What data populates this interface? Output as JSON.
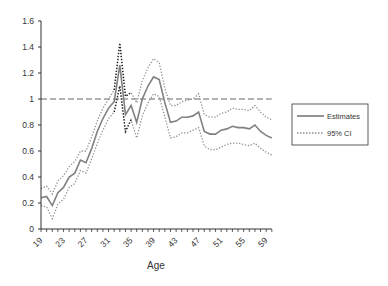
{
  "chart_data": {
    "type": "line",
    "title": "",
    "xlabel": "Age",
    "ylabel": "",
    "ylim": [
      0,
      1.6
    ],
    "xlim": [
      19,
      60
    ],
    "yticks": [
      "0",
      "0.2",
      "0.4",
      "0.6",
      "0.8",
      "1",
      "1.2",
      "1.4",
      "1.6"
    ],
    "xticks": [
      "19",
      "23",
      "27",
      "31",
      "35",
      "39",
      "43",
      "47",
      "51",
      "55",
      "59"
    ],
    "grid": false,
    "legend_position": "right",
    "reference_line": {
      "y": 1,
      "style": "dashed"
    },
    "x": [
      19,
      20,
      21,
      22,
      23,
      24,
      25,
      26,
      27,
      28,
      29,
      30,
      31,
      32,
      33,
      34,
      35,
      36,
      37,
      38,
      39,
      40,
      41,
      42,
      43,
      44,
      45,
      46,
      47,
      48,
      49,
      50,
      51,
      52,
      53,
      54,
      55,
      56,
      57,
      58,
      59,
      60
    ],
    "series": [
      {
        "name": "Estimates",
        "style": "solid",
        "values": [
          0.24,
          0.25,
          0.18,
          0.28,
          0.32,
          0.4,
          0.43,
          0.53,
          0.51,
          0.62,
          0.75,
          0.85,
          0.93,
          0.98,
          1.26,
          0.88,
          0.95,
          0.82,
          1.0,
          1.1,
          1.17,
          1.15,
          0.97,
          0.82,
          0.83,
          0.86,
          0.86,
          0.87,
          0.9,
          0.75,
          0.73,
          0.73,
          0.76,
          0.77,
          0.79,
          0.78,
          0.78,
          0.77,
          0.8,
          0.75,
          0.72,
          0.7
        ]
      },
      {
        "name": "95% CI upper",
        "style": "dotted",
        "values": [
          0.31,
          0.33,
          0.27,
          0.37,
          0.41,
          0.48,
          0.52,
          0.6,
          0.6,
          0.71,
          0.83,
          0.93,
          1.0,
          1.07,
          1.43,
          1.02,
          1.05,
          0.97,
          1.14,
          1.24,
          1.31,
          1.28,
          1.08,
          0.95,
          0.95,
          0.98,
          0.99,
          1.0,
          1.04,
          0.88,
          0.86,
          0.86,
          0.89,
          0.9,
          0.93,
          0.92,
          0.92,
          0.91,
          0.95,
          0.9,
          0.86,
          0.84
        ]
      },
      {
        "name": "95% CI lower",
        "style": "dotted",
        "values": [
          0.18,
          0.17,
          0.08,
          0.19,
          0.23,
          0.32,
          0.35,
          0.45,
          0.43,
          0.54,
          0.66,
          0.76,
          0.85,
          0.9,
          1.1,
          0.75,
          0.84,
          0.7,
          0.87,
          0.97,
          1.04,
          1.02,
          0.86,
          0.7,
          0.71,
          0.74,
          0.74,
          0.76,
          0.78,
          0.64,
          0.61,
          0.61,
          0.63,
          0.65,
          0.66,
          0.66,
          0.65,
          0.64,
          0.66,
          0.62,
          0.59,
          0.57
        ]
      }
    ]
  },
  "legend": {
    "items": [
      {
        "label": "Estimates"
      },
      {
        "label": "95% CI"
      }
    ]
  },
  "axes": {
    "xlabel": "Age"
  },
  "colors": {
    "estimate": "#808080",
    "ci": "#909090",
    "ci_dark": "#222222",
    "axis": "#333333",
    "reference": "#666666"
  }
}
